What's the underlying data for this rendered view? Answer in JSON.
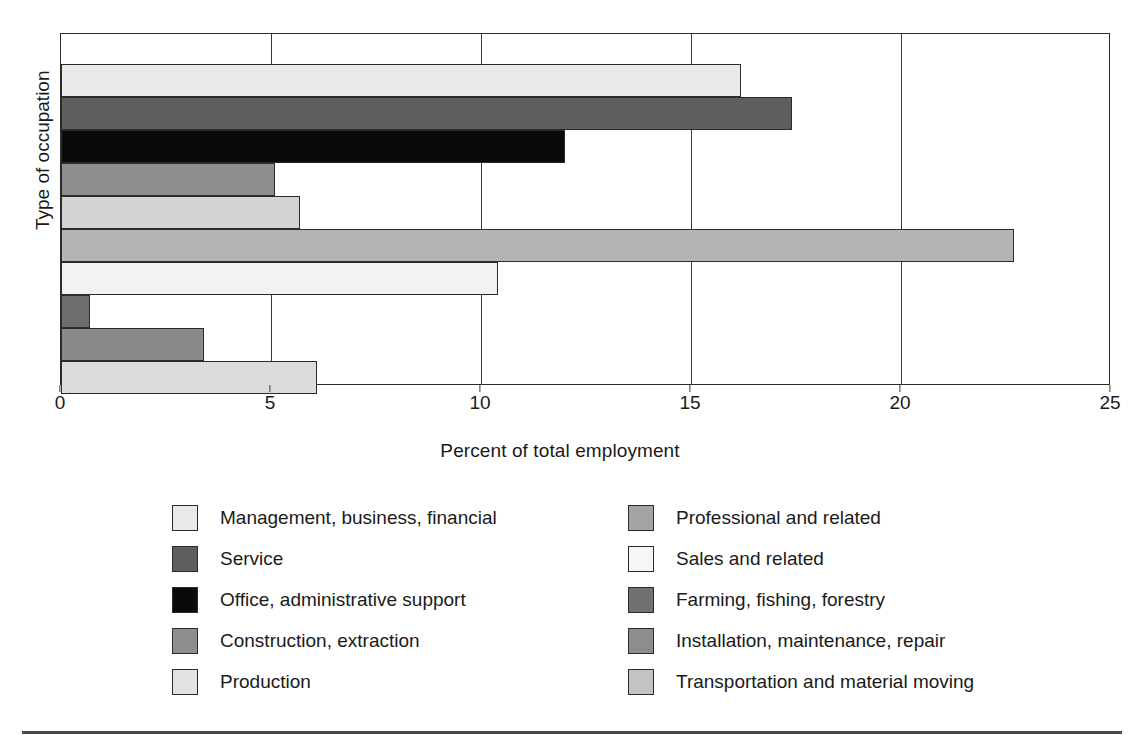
{
  "chart_data": {
    "type": "bar",
    "orientation": "horizontal",
    "title": "",
    "xlabel": "Percent of total employment",
    "ylabel": "Type of occupation",
    "xlim": [
      0,
      25
    ],
    "xticks": [
      0,
      5,
      10,
      15,
      20,
      25
    ],
    "xtick_labels": [
      "0",
      "5",
      "10",
      "15",
      "20",
      "25"
    ],
    "grid": true,
    "legend_position": "bottom",
    "categories": [
      "Management, business, financial",
      "Professional and related",
      "Service",
      "Office, administrative support",
      "Sales and related",
      "Farming, fishing, forestry",
      "Construction, extraction",
      "Installation, maintenance, repair",
      "Production",
      "Transportation and material moving"
    ],
    "bars": [
      {
        "label": "Management, business, financial",
        "value": 16.2,
        "color": "#e9e9e9"
      },
      {
        "label": "Professional and related",
        "value": 17.4,
        "color": "#5e5e5e"
      },
      {
        "label": "Service",
        "value": 12.0,
        "color": "#0a0a0a"
      },
      {
        "label": "Office, administrative support",
        "value": 5.1,
        "color": "#8e8e8e"
      },
      {
        "label": "Sales and related",
        "value": 5.7,
        "color": "#d2d2d2"
      },
      {
        "label": "Farming, fishing, forestry",
        "value": 22.7,
        "color": "#b4b4b4"
      },
      {
        "label": "Construction, extraction",
        "value": 10.4,
        "color": "#f2f2f2"
      },
      {
        "label": "Installation, maintenance, repair",
        "value": 0.7,
        "color": "#6e6e6e"
      },
      {
        "label": "Production",
        "value": 3.4,
        "color": "#8a8a8a"
      },
      {
        "label": "Transportation and material moving",
        "value": 6.1,
        "color": "#dcdcdc"
      }
    ]
  },
  "legend": {
    "left_column": [
      {
        "label": "Management, business, financial",
        "color": "#e9e9e9"
      },
      {
        "label": "Service",
        "color": "#5e5e5e"
      },
      {
        "label": "Office, administrative support",
        "color": "#0a0a0a"
      },
      {
        "label": "Construction, extraction",
        "color": "#8e8e8e"
      },
      {
        "label": "Production",
        "color": "#e2e2e2"
      }
    ],
    "right_column": [
      {
        "label": "Professional and related",
        "color": "#a4a4a4"
      },
      {
        "label": "Sales and related",
        "color": "#f6f6f6"
      },
      {
        "label": "Farming, fishing, forestry",
        "color": "#717171"
      },
      {
        "label": "Installation, maintenance, repair",
        "color": "#8d8d8d"
      },
      {
        "label": "Transportation and material moving",
        "color": "#c3c3c3"
      }
    ]
  },
  "colors": {
    "axis": "#2b2b2b",
    "grid": "#3a3a3a",
    "text": "#1a1a1a",
    "background": "#ffffff",
    "rule": "#4a4a4a"
  }
}
